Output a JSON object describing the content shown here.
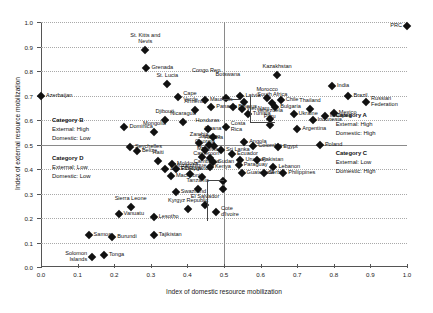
{
  "chart_data": {
    "type": "scatter",
    "title": "",
    "xlabel": "Index of domestic resource mobilization",
    "ylabel": "Index of external resource mobilization",
    "xlim": [
      0.0,
      1.0
    ],
    "ylim": [
      0.0,
      1.0
    ],
    "xticks": [
      "0.0",
      "0.1",
      "0.2",
      "0.3",
      "0.4",
      "0.5",
      "0.6",
      "0.7",
      "0.8",
      "0.9",
      "1.0"
    ],
    "yticks": [
      "0.0",
      "0.1",
      "0.2",
      "0.3",
      "0.4",
      "0.5",
      "0.6",
      "0.7",
      "0.8",
      "0.9",
      "1.0"
    ],
    "grid": true,
    "legend": "none",
    "reference_lines": {
      "x": 0.5,
      "y": 0.5
    },
    "marker": "diamond",
    "marker_color": "#111111",
    "points": [
      {
        "name": "PRC",
        "x": 1.0,
        "y": 0.985,
        "lp": "r"
      },
      {
        "name": "St. Kitts and\nNevis",
        "x": 0.285,
        "y": 0.885,
        "lp": "above"
      },
      {
        "name": "Grenada",
        "x": 0.288,
        "y": 0.812,
        "lp": "right"
      },
      {
        "name": "St. Lucia",
        "x": 0.345,
        "y": 0.745,
        "lp": "above"
      },
      {
        "name": "Cape\nVerde",
        "x": 0.375,
        "y": 0.695,
        "lp": "right"
      },
      {
        "name": "Azerbaijan",
        "x": 0.0,
        "y": 0.7,
        "lp": "right"
      },
      {
        "name": "Congo Rep.",
        "x": 0.505,
        "y": 0.69,
        "lp": "leader"
      },
      {
        "name": "Kazakhstan",
        "x": 0.645,
        "y": 0.783,
        "lp": "above"
      },
      {
        "name": "India",
        "x": 0.795,
        "y": 0.74,
        "lp": "right"
      },
      {
        "name": "Brazil",
        "x": 0.84,
        "y": 0.7,
        "lp": "right"
      },
      {
        "name": "Russian\nFederation",
        "x": 0.888,
        "y": 0.672,
        "lp": "right"
      },
      {
        "name": "Mauritius",
        "x": 0.448,
        "y": 0.682,
        "lp": "right"
      },
      {
        "name": "Latvia",
        "x": 0.545,
        "y": 0.7,
        "lp": "right"
      },
      {
        "name": "Botswana",
        "x": 0.555,
        "y": 0.672,
        "lp": "leader"
      },
      {
        "name": "Morocco",
        "x": 0.618,
        "y": 0.69,
        "lp": "above"
      },
      {
        "name": "Chile",
        "x": 0.655,
        "y": 0.68,
        "lp": "right"
      },
      {
        "name": "South Africa",
        "x": 0.632,
        "y": 0.668,
        "lp": "above"
      },
      {
        "name": "Panama",
        "x": 0.465,
        "y": 0.655,
        "lp": "right"
      },
      {
        "name": "Armenia",
        "x": 0.42,
        "y": 0.64,
        "lp": "above"
      },
      {
        "name": "Belarus",
        "x": 0.525,
        "y": 0.655,
        "lp": "right"
      },
      {
        "name": "Viet Nam",
        "x": 0.548,
        "y": 0.645,
        "lp": "right"
      },
      {
        "name": "Bulgaria",
        "x": 0.64,
        "y": 0.652,
        "lp": "right"
      },
      {
        "name": "Thailand",
        "x": 0.735,
        "y": 0.645,
        "lp": "above"
      },
      {
        "name": "Mexico",
        "x": 0.8,
        "y": 0.63,
        "lp": "right"
      },
      {
        "name": "Tunisia",
        "x": 0.565,
        "y": 0.625,
        "lp": "right"
      },
      {
        "name": "Ukraine",
        "x": 0.69,
        "y": 0.625,
        "lp": "right"
      },
      {
        "name": "Malaysia",
        "x": 0.775,
        "y": 0.618,
        "lp": "right"
      },
      {
        "name": "Djibouti",
        "x": 0.338,
        "y": 0.6,
        "lp": "above"
      },
      {
        "name": "Nicaragua",
        "x": 0.388,
        "y": 0.59,
        "lp": "above"
      },
      {
        "name": "Venezuela",
        "x": 0.625,
        "y": 0.605,
        "lp": "above"
      },
      {
        "name": "Indonesia",
        "x": 0.742,
        "y": 0.6,
        "lp": "right"
      },
      {
        "name": "Dominica",
        "x": 0.228,
        "y": 0.57,
        "lp": "right"
      },
      {
        "name": "Mongolia",
        "x": 0.31,
        "y": 0.552,
        "lp": "above"
      },
      {
        "name": "Honduras",
        "x": 0.455,
        "y": 0.565,
        "lp": "above"
      },
      {
        "name": "Costa\nRica",
        "x": 0.505,
        "y": 0.57,
        "lp": "right"
      },
      {
        "name": "Peru",
        "x": 0.625,
        "y": 0.58,
        "lp": "above"
      },
      {
        "name": "Argentina",
        "x": 0.7,
        "y": 0.562,
        "lp": "right"
      },
      {
        "name": "Ghana",
        "x": 0.47,
        "y": 0.53,
        "lp": "above"
      },
      {
        "name": "Zambia",
        "x": 0.432,
        "y": 0.505,
        "lp": "above"
      },
      {
        "name": "Santiago",
        "x": 0.46,
        "y": 0.5,
        "lp": "above"
      },
      {
        "name": "Albania",
        "x": 0.472,
        "y": 0.492,
        "lp": "above"
      },
      {
        "name": "Seychelles",
        "x": 0.243,
        "y": 0.488,
        "lp": "right"
      },
      {
        "name": "Belize",
        "x": 0.262,
        "y": 0.472,
        "lp": "right"
      },
      {
        "name": "Georgia",
        "x": 0.448,
        "y": 0.478,
        "lp": "above"
      },
      {
        "name": "Sri Lanka",
        "x": 0.492,
        "y": 0.478,
        "lp": "right"
      },
      {
        "name": "Angola",
        "x": 0.555,
        "y": 0.51,
        "lp": "right"
      },
      {
        "name": "Colombia",
        "x": 0.58,
        "y": 0.492,
        "lp": "right"
      },
      {
        "name": "Egypt",
        "x": 0.648,
        "y": 0.49,
        "lp": "right"
      },
      {
        "name": "Poland",
        "x": 0.762,
        "y": 0.498,
        "lp": "right"
      },
      {
        "name": "Haiti",
        "x": 0.32,
        "y": 0.432,
        "lp": "above"
      },
      {
        "name": "Moldova",
        "x": 0.358,
        "y": 0.42,
        "lp": "right"
      },
      {
        "name": "Mali",
        "x": 0.44,
        "y": 0.45,
        "lp": "above"
      },
      {
        "name": "Bolivia",
        "x": 0.462,
        "y": 0.445,
        "lp": "above"
      },
      {
        "name": "Sudan",
        "x": 0.47,
        "y": 0.43,
        "lp": "right"
      },
      {
        "name": "Ecuador",
        "x": 0.522,
        "y": 0.462,
        "lp": "right"
      },
      {
        "name": "Uruguay",
        "x": 0.545,
        "y": 0.438,
        "lp": "right"
      },
      {
        "name": "Pakistan",
        "x": 0.59,
        "y": 0.438,
        "lp": "right"
      },
      {
        "name": "Lao PDR",
        "x": 0.34,
        "y": 0.398,
        "lp": "right"
      },
      {
        "name": "Ethiopia",
        "x": 0.368,
        "y": 0.398,
        "lp": "right"
      },
      {
        "name": "Kenya",
        "x": 0.462,
        "y": 0.41,
        "lp": "right"
      },
      {
        "name": "Paraguay",
        "x": 0.54,
        "y": 0.415,
        "lp": "right"
      },
      {
        "name": "Lebanon",
        "x": 0.635,
        "y": 0.408,
        "lp": "right"
      },
      {
        "name": "Mozambique",
        "x": 0.408,
        "y": 0.378,
        "lp": "above"
      },
      {
        "name": "Macedonia",
        "x": 0.355,
        "y": 0.372,
        "lp": "right"
      },
      {
        "name": "Uganda",
        "x": 0.44,
        "y": 0.368,
        "lp": "above"
      },
      {
        "name": "Guatemala",
        "x": 0.548,
        "y": 0.385,
        "lp": "right"
      },
      {
        "name": "Serbia",
        "x": 0.608,
        "y": 0.385,
        "lp": "right"
      },
      {
        "name": "Philippines",
        "x": 0.662,
        "y": 0.382,
        "lp": "right"
      },
      {
        "name": "Swaziland",
        "x": 0.368,
        "y": 0.308,
        "lp": "right"
      },
      {
        "name": "Tanzania",
        "x": 0.428,
        "y": 0.318,
        "lp": "above"
      },
      {
        "name": "Cameroon",
        "x": 0.498,
        "y": 0.35,
        "lp": "leader"
      },
      {
        "name": "Cambodia",
        "x": 0.498,
        "y": 0.318,
        "lp": "leader"
      },
      {
        "name": "Sierra Leone",
        "x": 0.245,
        "y": 0.245,
        "lp": "above"
      },
      {
        "name": "Vanuatu",
        "x": 0.212,
        "y": 0.218,
        "lp": "right"
      },
      {
        "name": "Kyrgyz Republic",
        "x": 0.402,
        "y": 0.238,
        "lp": "above"
      },
      {
        "name": "El Salvador",
        "x": 0.448,
        "y": 0.252,
        "lp": "above"
      },
      {
        "name": "Lesotho",
        "x": 0.308,
        "y": 0.205,
        "lp": "right"
      },
      {
        "name": "Cote\nd'Ivoire",
        "x": 0.478,
        "y": 0.225,
        "lp": "right"
      },
      {
        "name": "Samoa",
        "x": 0.13,
        "y": 0.13,
        "lp": "right"
      },
      {
        "name": "Burundi",
        "x": 0.195,
        "y": 0.122,
        "lp": "right"
      },
      {
        "name": "Tajikistan",
        "x": 0.308,
        "y": 0.132,
        "lp": "right"
      },
      {
        "name": "Solomon\nIslands",
        "x": 0.14,
        "y": 0.042,
        "lp": "left"
      },
      {
        "name": "Tonga",
        "x": 0.172,
        "y": 0.048,
        "lp": "right"
      }
    ],
    "annotations": [
      {
        "id": "category-a",
        "title": "Category A",
        "line1": "External: High",
        "line2": "Domestic: High"
      },
      {
        "id": "category-b",
        "title": "Category B",
        "line1": "External: High",
        "line2": "Domestic: Low"
      },
      {
        "id": "category-c",
        "title": "Category C",
        "line1": "External: Low",
        "line2": "Domestic: High"
      },
      {
        "id": "category-d",
        "title": "Category D",
        "line1": "External: Low",
        "line2": "Domestic: Low"
      }
    ]
  }
}
